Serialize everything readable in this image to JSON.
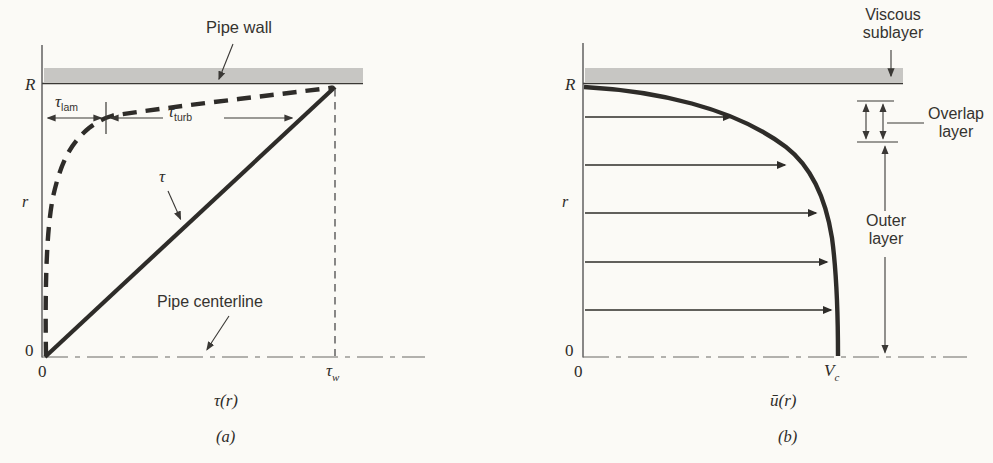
{
  "colors": {
    "background": "#fbfaf6",
    "ink": "#2e2c29",
    "pipe_wall_band": "#c7c6c3",
    "thin_line": "#4a4a4a"
  },
  "panel_a": {
    "pipe_wall_label": "Pipe wall",
    "pipe_centerline_label": "Pipe centerline",
    "y_top_tick_label": "R",
    "y_axis_label": "r",
    "y_origin_label": "0",
    "x_origin_label": "0",
    "tau_lam": {
      "base": "τ",
      "sub": "lam"
    },
    "tau_turb": {
      "base": "τ",
      "sub": "turb"
    },
    "tau_curve_label": "τ",
    "tau_w": {
      "base": "τ",
      "sub": "w"
    },
    "x_axis_label": "τ(r)",
    "caption": "(a)"
  },
  "panel_b": {
    "viscous_sublayer": {
      "line1": "Viscous",
      "line2": "sublayer"
    },
    "overlap_layer": {
      "line1": "Overlap",
      "line2": "layer"
    },
    "outer_layer": {
      "line1": "Outer",
      "line2": "layer"
    },
    "y_top_tick_label": "R",
    "y_axis_label": "r",
    "y_origin_label": "0",
    "x_origin_label": "0",
    "v_c": {
      "base": "V",
      "sub": "c"
    },
    "x_axis_label": "ū(r)",
    "caption": "(b)"
  }
}
